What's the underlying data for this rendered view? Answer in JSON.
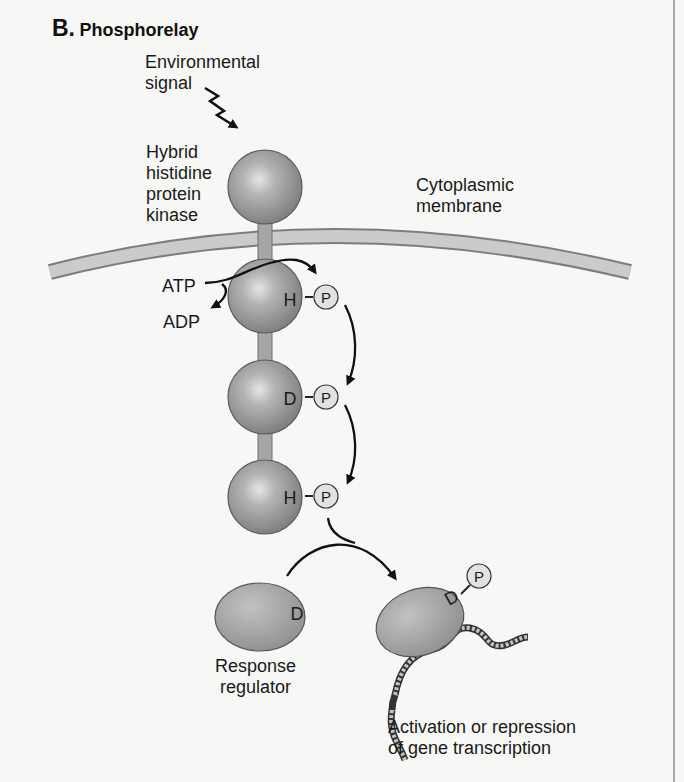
{
  "title": {
    "letter": "B.",
    "text": "Phosphorelay"
  },
  "labels": {
    "environmental_signal": "Environmental\nsignal",
    "hybrid_kinase": "Hybrid\nhistidine\nprotein\nkinase",
    "membrane": "Cytoplasmic\nmembrane",
    "atp": "ATP",
    "adp": "ADP",
    "response_regulator": "Response\nregulator",
    "outcome": "Activation or repression\nof gene transcription"
  },
  "kinase_domains": [
    {
      "residue": "H",
      "phosphate": "P"
    },
    {
      "residue": "D",
      "phosphate": "P"
    },
    {
      "residue": "H",
      "phosphate": "P"
    }
  ],
  "regulator": {
    "unphosphorylated": {
      "residue": "D"
    },
    "phosphorylated": {
      "residue": "D",
      "phosphate": "P"
    }
  },
  "colors": {
    "sphere": "#9a9a9a",
    "membrane": "#c8c8c8",
    "phosphate": "#e0e0e0",
    "arrow": "#111111"
  }
}
